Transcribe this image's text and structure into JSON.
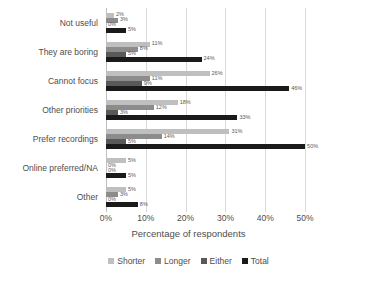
{
  "chart_data": {
    "type": "bar",
    "orientation": "horizontal",
    "title": "",
    "xlabel": "Percentage of respondents",
    "ylabel": "",
    "xlim": [
      0,
      55
    ],
    "xticks": [
      0,
      10,
      20,
      30,
      40,
      50
    ],
    "xtick_labels": [
      "0%",
      "10%",
      "20%",
      "30%",
      "40%",
      "50%"
    ],
    "grid": true,
    "legend_position": "bottom",
    "categories": [
      "Not useful",
      "They are boring",
      "Cannot focus",
      "Other priorities",
      "Prefer recordings",
      "Online preferred/NA",
      "Other"
    ],
    "series": [
      {
        "name": "Shorter",
        "color": "#bfbfbf",
        "values": [
          2,
          11,
          26,
          18,
          31,
          5,
          5
        ],
        "labels": [
          "2%",
          "11%",
          "26%",
          "18%",
          "31%",
          "5%",
          "5%"
        ]
      },
      {
        "name": "Longer",
        "color": "#8c8c8c",
        "values": [
          3,
          8,
          11,
          12,
          14,
          0,
          3
        ],
        "labels": [
          "3%",
          "8%",
          "11%",
          "12%",
          "14%",
          "0%",
          "3%"
        ]
      },
      {
        "name": "Either",
        "color": "#595959",
        "values": [
          0,
          5,
          9,
          3,
          5,
          0,
          0
        ],
        "labels": [
          "0%",
          "5%",
          "9%",
          "3%",
          "5%",
          "0%",
          "0%"
        ]
      },
      {
        "name": "Total",
        "color": "#1a1a1a",
        "values": [
          5,
          24,
          46,
          33,
          50,
          5,
          8
        ],
        "labels": [
          "5%",
          "24%",
          "46%",
          "33%",
          "50%",
          "5%",
          "8%"
        ]
      }
    ]
  }
}
